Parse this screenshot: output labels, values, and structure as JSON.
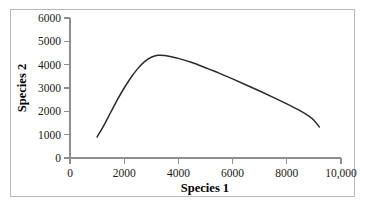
{
  "chart_data": {
    "type": "line",
    "title": "",
    "xlabel": "Species 1",
    "ylabel": "Species 2",
    "xlim": [
      0,
      10000
    ],
    "ylim": [
      0,
      6000
    ],
    "grid": false,
    "legend": null,
    "x_ticks": [
      0,
      2000,
      4000,
      6000,
      8000,
      10000
    ],
    "x_tick_labels": [
      "0",
      "2000",
      "4000",
      "6000",
      "8000",
      "10,000"
    ],
    "y_ticks": [
      0,
      1000,
      2000,
      3000,
      4000,
      5000,
      6000
    ],
    "y_tick_labels": [
      "0",
      "1000",
      "2000",
      "3000",
      "4000",
      "5000",
      "6000"
    ],
    "series": [
      {
        "name": "isocline",
        "color": "#2b2b2b",
        "x": [
          1000,
          1250,
          1500,
          1750,
          2000,
          2250,
          2500,
          2750,
          3000,
          3250,
          3500,
          3750,
          4000,
          4500,
          5000,
          5500,
          6000,
          6500,
          7000,
          7500,
          8000,
          8500,
          8800,
          9000,
          9200
        ],
        "y": [
          900,
          1400,
          1950,
          2500,
          3000,
          3450,
          3830,
          4130,
          4320,
          4400,
          4390,
          4340,
          4270,
          4090,
          3870,
          3640,
          3390,
          3130,
          2870,
          2600,
          2320,
          2020,
          1810,
          1620,
          1330
        ]
      }
    ]
  },
  "figure": {
    "curve_color": "#2b2b2b",
    "axis_color": "#8e8e8e",
    "frame_color": "#b9b9b9",
    "background_color": "#ffffff",
    "text_color": "#1a1a1a"
  }
}
